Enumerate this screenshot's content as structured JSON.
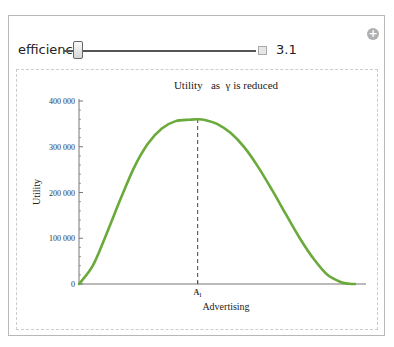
{
  "controls": {
    "label": "efficiency",
    "value": "3.1",
    "slider_fraction": 0.03,
    "add_icon": "plus-circle-icon",
    "stepper_icon": "plus-square-icon"
  },
  "colors": {
    "curve": "#6aaa3a",
    "axis": "#777777",
    "marker": "#444444"
  },
  "chart_data": {
    "type": "line",
    "title": "Utility   as  γ is reduced",
    "xlabel": "Advertising",
    "ylabel": "Utility",
    "ylim": [
      0,
      400000
    ],
    "xlim": [
      0,
      1
    ],
    "yticks": [
      0,
      100000,
      200000,
      300000,
      400000
    ],
    "ytick_labels": [
      "0",
      "100 000",
      "200 000",
      "300 000",
      "400 000"
    ],
    "xticks": [
      0.43
    ],
    "xtick_labels": [
      "A₁"
    ],
    "marker_line_x": 0.43,
    "series": [
      {
        "name": "Utility",
        "x": [
          0,
          0.05,
          0.1,
          0.15,
          0.2,
          0.25,
          0.3,
          0.35,
          0.4,
          0.43,
          0.46,
          0.5,
          0.55,
          0.6,
          0.65,
          0.7,
          0.75,
          0.8,
          0.85,
          0.9,
          0.95,
          0.98,
          1.0
        ],
        "y": [
          0,
          40000,
          110000,
          185000,
          255000,
          307000,
          340000,
          356000,
          359000,
          360000,
          358000,
          350000,
          330000,
          298000,
          255000,
          205000,
          152000,
          100000,
          55000,
          20000,
          4000,
          500,
          0
        ]
      }
    ]
  }
}
